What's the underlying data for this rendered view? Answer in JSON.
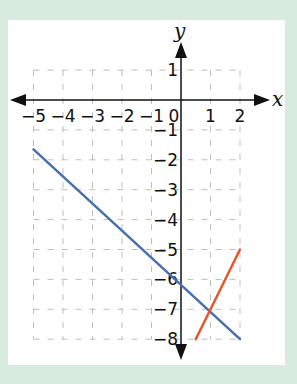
{
  "chart_data": {
    "type": "line",
    "title": "",
    "xlabel": "x",
    "ylabel": "y",
    "xlim": [
      -5,
      2
    ],
    "ylim": [
      -8,
      1
    ],
    "grid": true,
    "grid_style": "dashed",
    "x_ticks": [
      "-5",
      "-4",
      "-3",
      "-2",
      "-1",
      "0",
      "1",
      "2"
    ],
    "y_ticks": [
      "1",
      "-1",
      "-2",
      "-3",
      "-4",
      "-5",
      "-6",
      "-7",
      "-8"
    ],
    "series": [
      {
        "name": "blue line",
        "color": "#4a6fae",
        "points": [
          [
            -5,
            -1.65
          ],
          [
            2,
            -8
          ]
        ]
      },
      {
        "name": "orange line",
        "color": "#e8552a",
        "points": [
          [
            0.5,
            -8
          ],
          [
            2,
            -5
          ]
        ]
      }
    ],
    "intersection": [
      1,
      -7
    ]
  },
  "colors": {
    "background": "#d8ebdf",
    "panel": "#ffffff",
    "grid": "#bdbdbd",
    "axis": "#111111"
  }
}
